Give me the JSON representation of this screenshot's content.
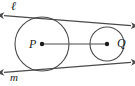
{
  "figure": {
    "kind": "geometry-diagram",
    "background_color": "#ffffff",
    "stroke_color": "#4a4a4a",
    "label_color": "#1a1a1a"
  },
  "labels": {
    "line_l": "ℓ",
    "line_m": "m",
    "point_p": "P",
    "point_q": "Q"
  },
  "geometry": {
    "circle_p": {
      "cx": 42,
      "cy": 44,
      "r": 27
    },
    "circle_q": {
      "cx": 107,
      "cy": 44,
      "r": 17
    },
    "segment_pq": {
      "x1": 42,
      "y1": 44,
      "x2": 107,
      "y2": 44
    },
    "tangent_l": {
      "x1": 2,
      "y1": 16,
      "x2": 133,
      "y2": 26
    },
    "tangent_m": {
      "x1": 2,
      "y1": 73,
      "x2": 133,
      "y2": 62
    },
    "center_dot_radius": 2.2,
    "arrowheads": [
      "tangent-l-left",
      "tangent-l-right",
      "tangent-m-left",
      "tangent-m-right"
    ]
  }
}
